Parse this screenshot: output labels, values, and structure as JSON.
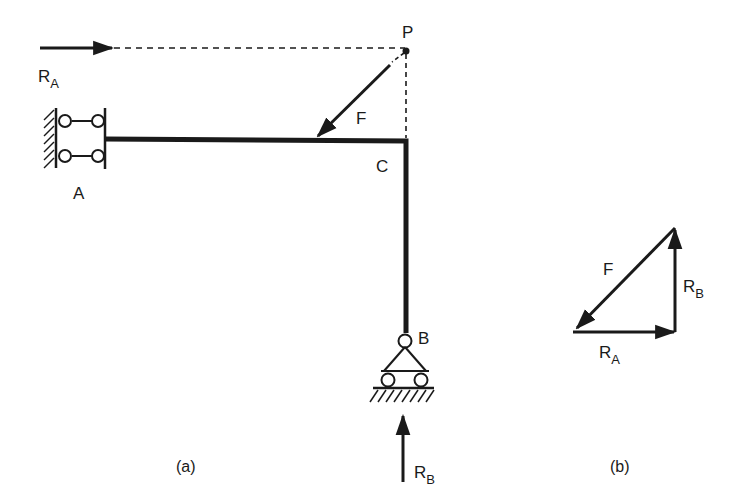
{
  "figure_a": {
    "caption": "(a)",
    "labels": {
      "RA_main": "R",
      "RA_sub": "A",
      "point_P": "P",
      "force_F": "F",
      "joint_C": "C",
      "support_A": "A",
      "support_B": "B",
      "RB_main": "R",
      "RB_sub": "B"
    }
  },
  "figure_b": {
    "caption": "(b)",
    "labels": {
      "force_F": "F",
      "RB_main": "R",
      "RB_sub": "B",
      "RA_main": "R",
      "RA_sub": "A"
    }
  },
  "colors": {
    "ink": "#1a1a1a",
    "background": "#ffffff"
  }
}
